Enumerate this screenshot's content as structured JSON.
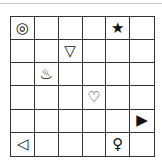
{
  "board": {
    "rows": 6,
    "cols": 6,
    "cells": [
      [
        "◎",
        "",
        "",
        "",
        "★",
        ""
      ],
      [
        "",
        "",
        "▽",
        "",
        "",
        ""
      ],
      [
        "",
        "♨",
        "",
        "",
        "",
        ""
      ],
      [
        "",
        "",
        "",
        "♡",
        "",
        ""
      ],
      [
        "",
        "",
        "",
        "",
        "",
        "▶"
      ],
      [
        "◁",
        "",
        "",
        "",
        "♀",
        ""
      ]
    ],
    "icon_names": {
      "◎": "bullseye-icon",
      "★": "star-icon",
      "▽": "triangle-down-icon",
      "♨": "hot-springs-icon",
      "♡": "heart-icon",
      "▶": "triangle-right-filled-icon",
      "◁": "triangle-left-icon",
      "♀": "female-symbol-icon"
    }
  }
}
